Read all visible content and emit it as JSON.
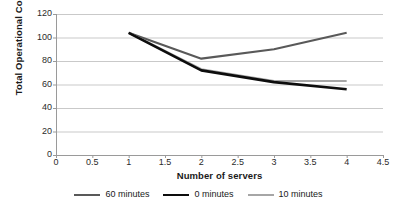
{
  "chart_data": {
    "type": "line",
    "title": "",
    "xlabel": "Number of servers",
    "ylabel": "Total Operational Cost",
    "x": [
      1,
      2,
      3,
      4
    ],
    "xlim": [
      0,
      4.5
    ],
    "ylim": [
      0,
      120
    ],
    "xticks": [
      "0",
      "0.5",
      "1",
      "1.5",
      "2",
      "2.5",
      "3",
      "3.5",
      "4",
      "4.5"
    ],
    "yticks": [
      "0",
      "20",
      "40",
      "60",
      "80",
      "100",
      "120"
    ],
    "grid": "horizontal",
    "legend_position": "bottom",
    "series": [
      {
        "name": "60 minutes",
        "color": "#595959",
        "width": 2.1,
        "values": [
          104,
          82,
          90,
          104
        ]
      },
      {
        "name": "0 minutes",
        "color": "#0d0d0d",
        "width": 2.6,
        "values": [
          104,
          72,
          62,
          56
        ]
      },
      {
        "name": "10 minutes",
        "color": "#a6a6a6",
        "width": 2.1,
        "values": [
          104,
          73,
          63,
          63
        ]
      }
    ]
  },
  "axes": {
    "axis_color": "#9a9a9a",
    "grid_color": "#c9c9c9"
  }
}
